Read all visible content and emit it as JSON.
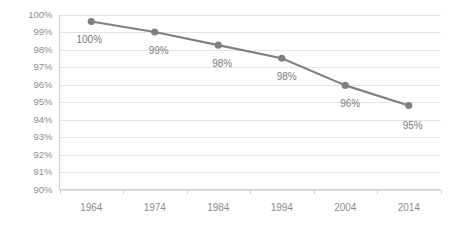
{
  "chart_data": {
    "type": "line",
    "title": "",
    "subtitle": "",
    "xlabel": "",
    "ylabel": "",
    "categories": [
      "1964",
      "1974",
      "1984",
      "1994",
      "2004",
      "2014"
    ],
    "x": [
      1964,
      1974,
      1984,
      1994,
      2004,
      2014
    ],
    "values": [
      99.6,
      99.0,
      98.25,
      97.5,
      95.95,
      94.8
    ],
    "point_labels": [
      "100%",
      "99%",
      "98%",
      "98%",
      "96%",
      "95%"
    ],
    "ylim": [
      90,
      100
    ],
    "ytick_values": [
      90,
      91,
      92,
      93,
      94,
      95,
      96,
      97,
      98,
      99,
      100
    ],
    "ytick_labels": [
      "90%",
      "91%",
      "92%",
      "93%",
      "94%",
      "95%",
      "96%",
      "97%",
      "98%",
      "99%",
      "100%"
    ],
    "xtick_labels": [
      "1964",
      "1974",
      "1984",
      "1994",
      "2004",
      "2014"
    ],
    "grid": true,
    "grid_axis": "y",
    "legend": false,
    "legend_position": "none",
    "series": [
      {
        "name": "",
        "values": [
          99.6,
          99.0,
          98.25,
          97.5,
          95.95,
          94.8
        ],
        "labels": [
          "100%",
          "99%",
          "98%",
          "98%",
          "96%",
          "95%"
        ]
      }
    ],
    "colors": {
      "line": "#808080",
      "marker": "#808080",
      "gridline": "#e4e4e4",
      "axis": "#d0d0d0",
      "tick_text": "#8c8c8c",
      "label_text": "#7a7a7a",
      "background": "#ffffff"
    }
  }
}
